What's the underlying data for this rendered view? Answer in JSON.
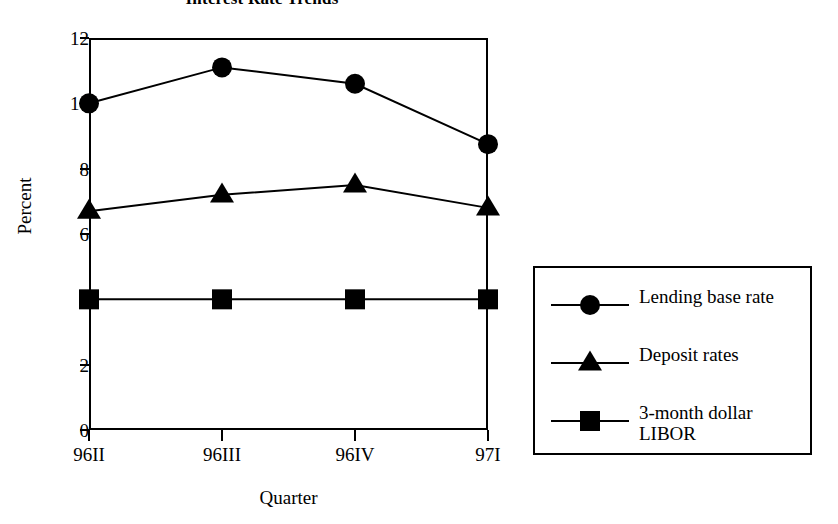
{
  "chart_data": {
    "type": "line",
    "title": "Interest Rate Trends",
    "xlabel": "Quarter",
    "ylabel": "Percent",
    "categories": [
      "96II",
      "96III",
      "96IV",
      "97I"
    ],
    "ylim": [
      0,
      12
    ],
    "yticks": [
      0,
      2,
      4,
      6,
      8,
      10,
      12
    ],
    "grid": false,
    "legend_position": "right",
    "series": [
      {
        "name": "Lending base rate",
        "marker": "circle",
        "color": "#000000",
        "values": [
          10.0,
          11.1,
          10.6,
          8.75
        ]
      },
      {
        "name": "Deposit rates",
        "marker": "triangle",
        "color": "#000000",
        "values": [
          6.7,
          7.2,
          7.5,
          6.8
        ]
      },
      {
        "name": "3-month dollar LIBOR",
        "marker": "square",
        "color": "#000000",
        "values": [
          4.0,
          4.0,
          4.0,
          4.0
        ]
      }
    ]
  },
  "legend": {
    "entries": [
      {
        "label": "Lending base rate",
        "marker": "circle"
      },
      {
        "label": "Deposit rates",
        "marker": "triangle"
      },
      {
        "label": "3-month dollar\nLIBOR",
        "marker": "square"
      }
    ]
  },
  "colors": {
    "ink": "#000000",
    "background": "#ffffff"
  }
}
